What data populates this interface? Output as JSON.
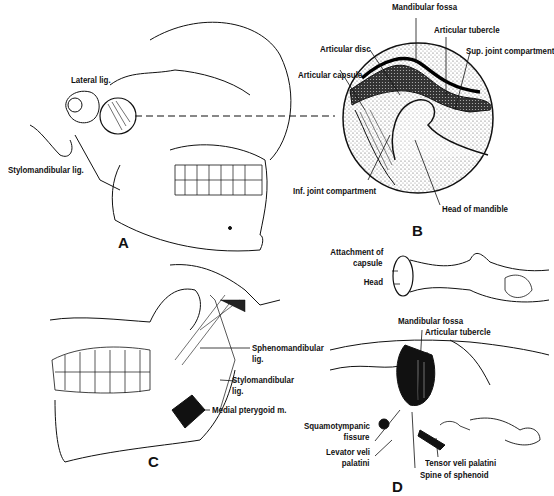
{
  "figure": {
    "panels": [
      {
        "id": "A",
        "letter": "A",
        "labels": {
          "lateral_lig": "Lateral lig.",
          "stylomandibular_lig": "Stylomandibular lig."
        }
      },
      {
        "id": "B",
        "letter": "B",
        "labels": {
          "mandibular_fossa": "Mandibular fossa",
          "articular_tubercle": "Articular tubercle",
          "sup_joint_compartment": "Sup. joint compartment",
          "articular_disc": "Articular disc",
          "articular_capsule": "Articular capsule",
          "inf_joint_compartment": "Inf. joint compartment",
          "head_of_mandible": "Head of mandible"
        }
      },
      {
        "id": "C",
        "letter": "C",
        "labels": {
          "sphenomandibular_lig_1": "Sphenomandibular",
          "sphenomandibular_lig_2": "lig.",
          "stylomandibular_lig_1": "Stylomandibular",
          "stylomandibular_lig_2": "lig.",
          "medial_pterygoid": "Medial pterygoid m."
        }
      },
      {
        "id": "D",
        "letter": "D",
        "labels": {
          "attachment_of_capsule_1": "Attachment of",
          "attachment_of_capsule_2": "capsule",
          "head": "Head",
          "mandibular_fossa": "Mandibular fossa",
          "articular_tubercle": "Articular tubercle",
          "squamotympanic_fissure_1": "Squamotympanic",
          "squamotympanic_fissure_2": "fissure",
          "levator_veli_palatini_1": "Levator veli",
          "levator_veli_palatini_2": "palatini",
          "tensor_veli_palatini": "Tensor veli palatini",
          "spine_of_sphenoid": "Spine of sphenoid"
        }
      }
    ],
    "colors": {
      "ink": "#111111",
      "background": "#ffffff",
      "stipple": "#8a8a8a"
    }
  }
}
